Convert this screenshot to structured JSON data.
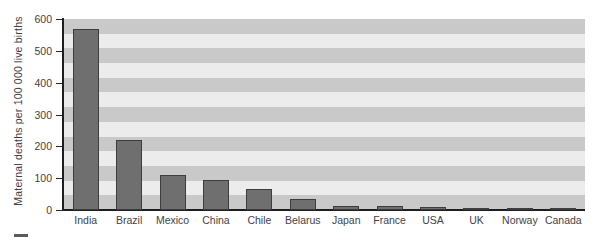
{
  "chart_data": {
    "type": "bar",
    "title": "",
    "xlabel": "",
    "ylabel": "Maternal deaths per 100 000 live births",
    "ylim": [
      0,
      600
    ],
    "ytick_labels": [
      "600",
      "500",
      "400",
      "300",
      "200",
      "100",
      "0"
    ],
    "yticks": [
      600,
      500,
      400,
      300,
      200,
      100,
      0
    ],
    "grid": "alternating-horizontal-bands",
    "legend": "none",
    "categories": [
      "India",
      "Brazil",
      "Mexico",
      "China",
      "Chile",
      "Belarus",
      "Japan",
      "France",
      "USA",
      "UK",
      "Norway",
      "Canada"
    ],
    "values": [
      570,
      220,
      110,
      95,
      65,
      35,
      12,
      13,
      8,
      7,
      6,
      6
    ],
    "bar_color": "#6f6f6f",
    "bar_edge_color": "#3d3d3d",
    "band_color": "#c9c9c9",
    "plot_background": "#ececec",
    "axis_color": "#1e1e1e"
  }
}
